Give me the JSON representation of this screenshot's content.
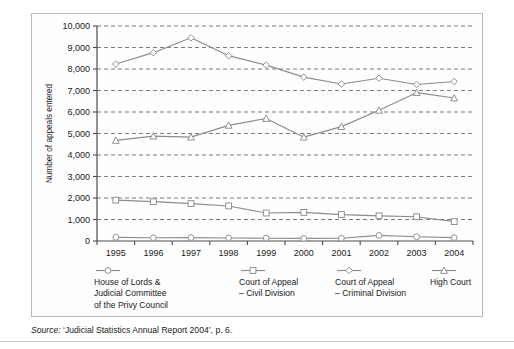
{
  "figure": {
    "source_prefix": "Source:",
    "source_text": " ‘Judicial Statistics Annual Report 2004’, p. 6."
  },
  "axis": {
    "y_title": "Number of appeals entered",
    "y_ticks": [
      "0",
      "1,000",
      "2,000",
      "3,000",
      "4,000",
      "5,000",
      "6,000",
      "7,000",
      "8,000",
      "9,000",
      "10,000"
    ],
    "x_ticks": [
      "1995",
      "1996",
      "1997",
      "1998",
      "1999",
      "2000",
      "2001",
      "2002",
      "2003",
      "2004"
    ]
  },
  "legend": {
    "items": [
      {
        "label": "House of Lords &\nJudicial Committee\nof the Privy Council",
        "marker": "circle",
        "color": "#8c8c8c"
      },
      {
        "label": "Court of Appeal\n– Civil Division",
        "marker": "square",
        "color": "#8c8c8c"
      },
      {
        "label": "Court of Appeal\n– Criminal Division",
        "marker": "diamond",
        "color": "#8c8c8c"
      },
      {
        "label": "High Court",
        "marker": "triangle",
        "color": "#8c8c8c"
      }
    ]
  },
  "chart_data": {
    "type": "line",
    "title": "",
    "xlabel": "",
    "ylabel": "Number of appeals entered",
    "categories": [
      "1995",
      "1996",
      "1997",
      "1998",
      "1999",
      "2000",
      "2001",
      "2002",
      "2003",
      "2004"
    ],
    "ylim": [
      0,
      10000
    ],
    "ytick_step": 1000,
    "grid": "horizontal-dashed",
    "legend_position": "bottom",
    "series": [
      {
        "name": "House of Lords & Judicial Committee of the Privy Council",
        "marker": "circle",
        "color": "#8c8c8c",
        "values": [
          170,
          150,
          160,
          140,
          130,
          120,
          130,
          260,
          200,
          160
        ]
      },
      {
        "name": "Court of Appeal – Civil Division",
        "marker": "square",
        "color": "#8c8c8c",
        "values": [
          1900,
          1830,
          1740,
          1630,
          1300,
          1330,
          1230,
          1170,
          1130,
          900
        ]
      },
      {
        "name": "Court of Appeal – Criminal Division",
        "marker": "diamond",
        "color": "#8c8c8c",
        "values": [
          8230,
          8760,
          9450,
          8620,
          8180,
          7620,
          7300,
          7570,
          7280,
          7420
        ]
      },
      {
        "name": "High Court",
        "marker": "triangle",
        "color": "#8c8c8c",
        "values": [
          4680,
          4880,
          4830,
          5380,
          5700,
          4830,
          5320,
          6080,
          6900,
          6650
        ]
      }
    ]
  }
}
